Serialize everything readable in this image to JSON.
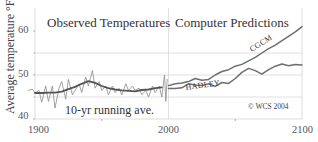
{
  "chart_data": {
    "type": "line",
    "title": "",
    "xlabel": "",
    "ylabel": "Average temperature °F",
    "xlim": [
      1900,
      2100
    ],
    "ylim": [
      40,
      64
    ],
    "x_ticks": [
      "1900",
      "2000",
      "2100"
    ],
    "y_ticks": [
      "40",
      "50",
      "60"
    ],
    "grid": {
      "horizontal": [
        45,
        50,
        55
      ],
      "vertical": [
        2000
      ]
    },
    "panels": [
      {
        "title": "Observed Temperatures",
        "x_range": [
          1895,
          2000
        ]
      },
      {
        "title": "Computer Predictions",
        "x_range": [
          2000,
          2100
        ]
      }
    ],
    "annotations": [
      "10-yr running ave.",
      "© WCS 2004"
    ],
    "series": [
      {
        "name": "Observed annual",
        "x": [
          1895,
          1898,
          1900,
          1903,
          1905,
          1908,
          1910,
          1913,
          1915,
          1918,
          1920,
          1923,
          1925,
          1928,
          1930,
          1933,
          1935,
          1938,
          1940,
          1943,
          1945,
          1948,
          1950,
          1953,
          1955,
          1958,
          1960,
          1963,
          1965,
          1968,
          1970,
          1973,
          1975,
          1978,
          1980,
          1983,
          1985,
          1988,
          1990,
          1993,
          1995,
          1997,
          1998,
          1999
        ],
        "values": [
          46.5,
          46.8,
          45.9,
          46.5,
          43.8,
          47.5,
          44.0,
          47.5,
          42.5,
          47.0,
          48.5,
          44.5,
          49.0,
          45.5,
          46.5,
          48.0,
          46.0,
          49.5,
          47.5,
          51.0,
          47.0,
          48.5,
          46.5,
          47.5,
          45.5,
          47.5,
          46.0,
          47.0,
          45.5,
          48.0,
          46.5,
          47.5,
          46.5,
          47.0,
          45.5,
          46.5,
          45.0,
          47.5,
          46.0,
          47.5,
          45.0,
          50.0,
          44.0,
          49.0
        ]
      },
      {
        "name": "10-yr running ave.",
        "x": [
          1900,
          1905,
          1910,
          1915,
          1920,
          1925,
          1930,
          1935,
          1940,
          1945,
          1950,
          1955,
          1960,
          1965,
          1970,
          1975,
          1980,
          1985,
          1990,
          1995
        ],
        "values": [
          45.9,
          45.9,
          46.0,
          46.0,
          46.2,
          46.8,
          47.3,
          48.0,
          48.6,
          48.2,
          47.5,
          47.0,
          46.7,
          46.5,
          46.4,
          46.3,
          46.6,
          46.7,
          47.0,
          47.2
        ]
      },
      {
        "name": "CGCM",
        "x": [
          2000,
          2005,
          2010,
          2015,
          2020,
          2025,
          2030,
          2035,
          2040,
          2045,
          2050,
          2055,
          2060,
          2065,
          2070,
          2075,
          2080,
          2085,
          2090,
          2095,
          2100
        ],
        "values": [
          47.6,
          48.0,
          48.2,
          48.5,
          49.2,
          48.8,
          49.0,
          50.0,
          50.8,
          51.2,
          52.0,
          52.4,
          53.2,
          54.0,
          55.0,
          56.0,
          56.8,
          57.8,
          58.8,
          59.8,
          61.0
        ]
      },
      {
        "name": "HADLEY",
        "x": [
          2000,
          2005,
          2010,
          2015,
          2020,
          2025,
          2030,
          2035,
          2040,
          2045,
          2050,
          2055,
          2060,
          2065,
          2070,
          2075,
          2080,
          2085,
          2090,
          2095,
          2100
        ],
        "values": [
          46.9,
          46.9,
          47.1,
          48.0,
          47.7,
          47.6,
          48.0,
          47.4,
          48.3,
          48.1,
          49.2,
          50.6,
          51.5,
          51.0,
          50.2,
          51.2,
          52.0,
          52.5,
          52.1,
          52.4,
          52.3
        ]
      }
    ]
  }
}
